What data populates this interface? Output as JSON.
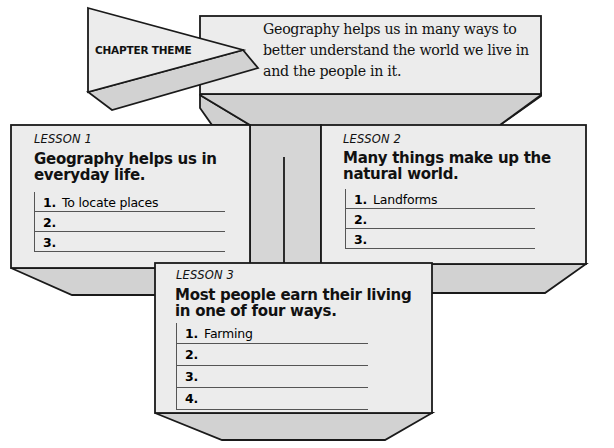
{
  "chapter_theme": {
    "label": "CHAPTER THEME",
    "lines": [
      "Geography helps us in many ways to",
      "better understand the world we live in",
      "and the people in it."
    ]
  },
  "lessons": [
    {
      "tag": "LESSON 1",
      "title_lines": [
        "Geography helps us in",
        "everyday life."
      ],
      "items": [
        {
          "num": "1.",
          "text": "To locate places"
        },
        {
          "num": "2.",
          "text": ""
        },
        {
          "num": "3.",
          "text": ""
        }
      ]
    },
    {
      "tag": "LESSON 2",
      "title_lines": [
        "Many things make up the",
        "natural world."
      ],
      "items": [
        {
          "num": "1.",
          "text": "Landforms"
        },
        {
          "num": "2.",
          "text": ""
        },
        {
          "num": "3.",
          "text": ""
        }
      ]
    },
    {
      "tag": "LESSON 3",
      "title_lines": [
        "Most people earn their living",
        "in one of four ways."
      ],
      "items": [
        {
          "num": "1.",
          "text": "Farming"
        },
        {
          "num": "2.",
          "text": ""
        },
        {
          "num": "3.",
          "text": ""
        },
        {
          "num": "4.",
          "text": ""
        }
      ]
    }
  ],
  "colors": {
    "face": "#ececec",
    "shade": "#d2d2d2",
    "line": "#1a1a1a"
  }
}
